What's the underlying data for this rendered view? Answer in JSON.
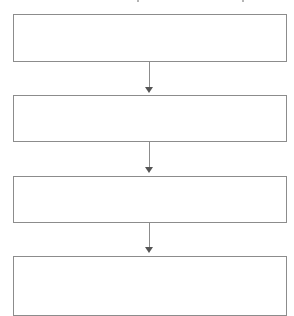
{
  "diagram": {
    "type": "vertical-flowchart",
    "colors": {
      "box_border": "#8c8c8c",
      "connector": "#8c8c8c",
      "arrowhead": "#555555",
      "background": "#ffffff"
    },
    "boxes": [
      {
        "label": ""
      },
      {
        "label": ""
      },
      {
        "label": ""
      },
      {
        "label": ""
      }
    ],
    "arrows": [
      {
        "from": 0,
        "to": 1
      },
      {
        "from": 1,
        "to": 2
      },
      {
        "from": 2,
        "to": 3
      }
    ]
  }
}
